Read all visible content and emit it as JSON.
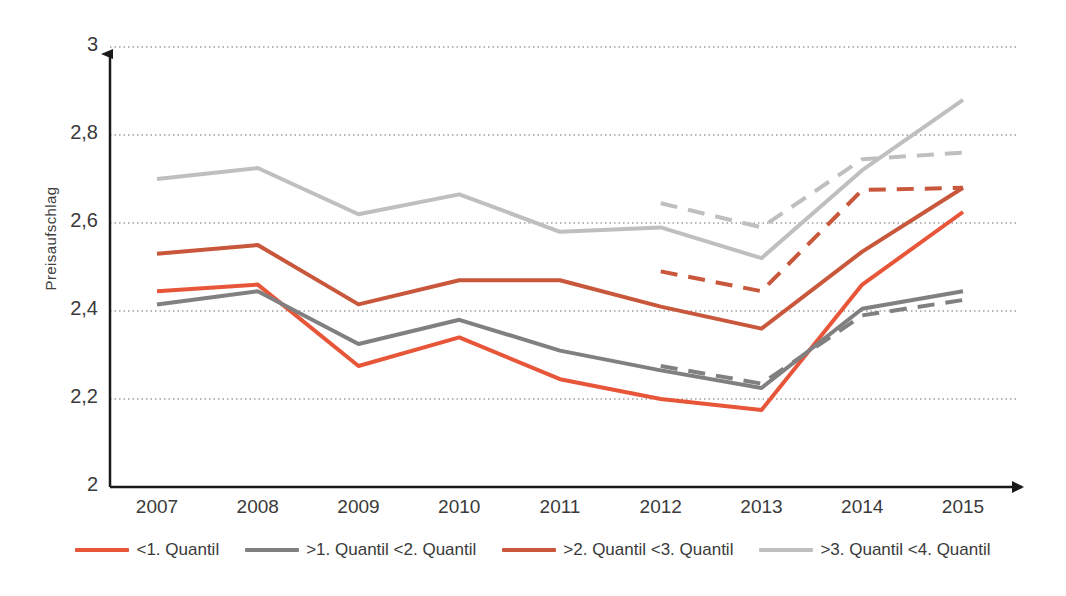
{
  "chart_data": {
    "type": "line",
    "title": "",
    "xlabel": "",
    "ylabel": "Preisaufschlag",
    "categories": [
      "2007",
      "2008",
      "2009",
      "2010",
      "2011",
      "2012",
      "2013",
      "2014",
      "2015"
    ],
    "x": [
      2007,
      2008,
      2009,
      2010,
      2011,
      2012,
      2013,
      2014,
      2015
    ],
    "ylim": [
      2,
      3
    ],
    "yticks": [
      "2",
      "2,2",
      "2,4",
      "2,6",
      "2,8",
      "3"
    ],
    "ytick_values": [
      2,
      2.2,
      2.4,
      2.6,
      2.8,
      3.0
    ],
    "grid": true,
    "legend_position": "bottom",
    "series": [
      {
        "name": "<1. Quantil",
        "color": "#E8563A",
        "style": "solid",
        "values": [
          2.445,
          2.46,
          2.275,
          2.34,
          2.245,
          2.2,
          2.175,
          2.46,
          2.625
        ]
      },
      {
        "name": ">1. Quantil <2. Quantil",
        "color": "#808080",
        "style": "solid",
        "values": [
          2.415,
          2.445,
          2.325,
          2.38,
          2.31,
          2.265,
          2.225,
          2.405,
          2.445
        ]
      },
      {
        "name": ">2. Quantil <3. Quantil",
        "color": "#C8573C",
        "style": "solid",
        "values": [
          2.53,
          2.55,
          2.415,
          2.47,
          2.47,
          2.41,
          2.36,
          2.535,
          2.68
        ]
      },
      {
        "name": ">3. Quantil <4. Quantil",
        "color": "#BFBFBF",
        "style": "solid",
        "values": [
          2.7,
          2.725,
          2.62,
          2.665,
          2.58,
          2.59,
          2.52,
          2.72,
          2.88
        ]
      },
      {
        "name": ">1. Quantil <2. Quantil (forecast)",
        "color": "#808080",
        "style": "dashed",
        "x": [
          2012,
          2013,
          2014,
          2015
        ],
        "values": [
          2.275,
          2.235,
          2.39,
          2.425
        ]
      },
      {
        "name": ">2. Quantil <3. Quantil (forecast)",
        "color": "#C8573C",
        "style": "dashed",
        "x": [
          2012,
          2013,
          2014,
          2015
        ],
        "values": [
          2.49,
          2.445,
          2.675,
          2.68
        ]
      },
      {
        "name": ">3. Quantil <4. Quantil (forecast)",
        "color": "#BFBFBF",
        "style": "dashed",
        "x": [
          2012,
          2013,
          2014,
          2015
        ],
        "values": [
          2.645,
          2.59,
          2.745,
          2.76
        ]
      }
    ],
    "legend": [
      {
        "label": "<1. Quantil",
        "color": "#E8563A"
      },
      {
        "label": ">1. Quantil <2. Quantil",
        "color": "#808080"
      },
      {
        "label": ">2. Quantil <3. Quantil",
        "color": "#C8573C"
      },
      {
        "label": ">3. Quantil <4. Quantil",
        "color": "#BFBFBF"
      }
    ]
  },
  "axis": {
    "y_title": "Preisaufschlag"
  }
}
